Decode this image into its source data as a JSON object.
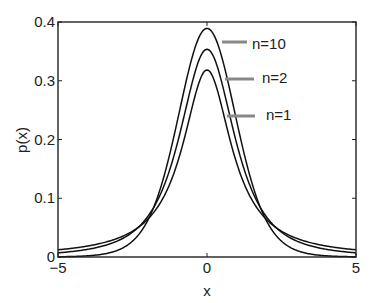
{
  "chart_data": {
    "type": "line",
    "title": "",
    "xlabel": "x",
    "ylabel": "p(x)",
    "xlim": [
      -5,
      5
    ],
    "ylim": [
      0,
      0.4
    ],
    "xticks": [
      "-5",
      "0",
      "5"
    ],
    "yticks": [
      "0",
      "0.1",
      "0.2",
      "0.3",
      "0.4"
    ],
    "grid": false,
    "distribution": "Student's t",
    "series": [
      {
        "name": "n=10",
        "nu": 10,
        "peak": 0.389,
        "values_at": {
          "-5": 0.0004,
          "-2": 0.061,
          "0": 0.389,
          "2": 0.061,
          "5": 0.0004
        }
      },
      {
        "name": "n=2",
        "nu": 2,
        "peak": 0.354,
        "values_at": {
          "-5": 0.007,
          "-2": 0.068,
          "0": 0.354,
          "2": 0.068,
          "5": 0.007
        }
      },
      {
        "name": "n=1",
        "nu": 1,
        "peak": 0.318,
        "values_at": {
          "-5": 0.012,
          "-2": 0.064,
          "0": 0.318,
          "2": 0.064,
          "5": 0.012
        }
      }
    ],
    "annotations": [
      {
        "text": "n=10",
        "label_x": 252,
        "label_y": 49,
        "line": [
          [
            222,
            42
          ],
          [
            247,
            42
          ]
        ]
      },
      {
        "text": "n=2",
        "label_x": 262,
        "label_y": 83,
        "line": [
          [
            225,
            79
          ],
          [
            254,
            79
          ]
        ]
      },
      {
        "text": "n=1",
        "label_x": 266,
        "label_y": 120,
        "line": [
          [
            227,
            116
          ],
          [
            255,
            116
          ]
        ]
      }
    ]
  }
}
